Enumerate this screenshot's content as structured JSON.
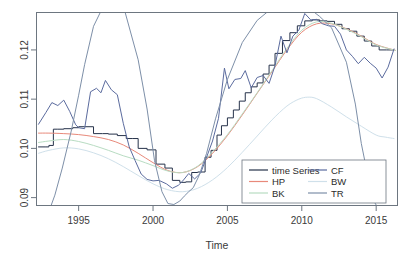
{
  "chart_data": {
    "type": "line",
    "title": "",
    "xlabel": "Time",
    "ylabel": "",
    "xlim": [
      1992.2,
      2016.4
    ],
    "ylim": [
      0.0885,
      0.1275
    ],
    "xticks": [
      1995,
      2000,
      2005,
      2010,
      2015
    ],
    "xtick_labels": [
      "1995",
      "2000",
      "2005",
      "2010",
      "2015"
    ],
    "yticks": [
      0.09,
      0.1,
      0.11,
      0.12
    ],
    "ytick_labels": [
      "0.09",
      "0.10",
      "0.11",
      "0.12"
    ],
    "grid": false,
    "legend_position": "bottom-right",
    "legend_columns": 2,
    "series": [
      {
        "name": "time Series",
        "color": "#26324a",
        "style": "step",
        "x": [
          1992.3,
          1992.8,
          1993.0,
          1993.3,
          1993.6,
          1994.0,
          1994.6,
          1995.0,
          1995.4,
          1996.0,
          1996.6,
          1997.0,
          1997.6,
          1998.2,
          1998.6,
          1999.0,
          1999.6,
          2000.2,
          2000.8,
          2001.3,
          2001.8,
          2002.2,
          2002.6,
          2003.0,
          2003.5,
          2003.9,
          2004.3,
          2004.6,
          2005.0,
          2005.4,
          2005.8,
          2006.2,
          2006.6,
          2007.0,
          2007.4,
          2007.8,
          2008.2,
          2008.7,
          2009.2,
          2009.7,
          2010.2,
          2010.7,
          2011.2,
          2011.7,
          2012.2,
          2012.7,
          2013.2,
          2013.7,
          2014.2,
          2014.7,
          2015.2,
          2015.7,
          2016.2
        ],
        "y": [
          0.1003,
          0.1003,
          0.1006,
          0.1039,
          0.1039,
          0.104,
          0.1042,
          0.1044,
          0.1044,
          0.103,
          0.103,
          0.1029,
          0.1026,
          0.102,
          0.102,
          0.1,
          0.0997,
          0.0968,
          0.096,
          0.0935,
          0.0931,
          0.0932,
          0.0951,
          0.0952,
          0.0982,
          0.0996,
          0.1027,
          0.1046,
          0.1062,
          0.1078,
          0.1096,
          0.1113,
          0.1125,
          0.1133,
          0.1151,
          0.1169,
          0.1193,
          0.1219,
          0.1235,
          0.1249,
          0.1259,
          0.1261,
          0.1259,
          0.1258,
          0.1252,
          0.1243,
          0.1238,
          0.1228,
          0.1218,
          0.1208,
          0.12,
          0.12,
          0.12
        ]
      },
      {
        "name": "HP",
        "color": "#e8897a",
        "style": "smooth",
        "x": [
          1992.3,
          1993.0,
          1994.0,
          1995.0,
          1996.0,
          1997.0,
          1998.0,
          1999.0,
          2000.0,
          2001.0,
          2002.0,
          2003.0,
          2004.0,
          2005.0,
          2006.0,
          2007.0,
          2008.0,
          2009.0,
          2010.0,
          2011.0,
          2012.0,
          2013.0,
          2014.0,
          2015.0,
          2016.3
        ],
        "y": [
          0.1031,
          0.1031,
          0.103,
          0.1028,
          0.1024,
          0.1018,
          0.1007,
          0.099,
          0.0971,
          0.0955,
          0.0951,
          0.0963,
          0.099,
          0.1026,
          0.1068,
          0.1112,
          0.1156,
          0.12,
          0.1236,
          0.1253,
          0.1253,
          0.1243,
          0.1228,
          0.1211,
          0.1199
        ]
      },
      {
        "name": "BK",
        "color": "#b8dcc2",
        "style": "smooth",
        "x": [
          1992.3,
          1993.0,
          1994.0,
          1995.0,
          1996.0,
          1997.0,
          1998.0,
          1999.0,
          2000.0,
          2001.0,
          2002.0,
          2003.0,
          2004.0,
          2005.0,
          2006.0,
          2007.0,
          2008.0,
          2009.0,
          2010.0,
          2011.0,
          2012.0,
          2013.0,
          2014.0,
          2015.0,
          2016.3
        ],
        "y": [
          0.1012,
          0.1015,
          0.1018,
          0.1014,
          0.1006,
          0.0996,
          0.0985,
          0.0976,
          0.0965,
          0.0954,
          0.0951,
          0.0964,
          0.0993,
          0.1028,
          0.107,
          0.1113,
          0.1158,
          0.1203,
          0.124,
          0.1257,
          0.1254,
          0.1242,
          0.1227,
          0.121,
          0.1199
        ]
      },
      {
        "name": "CF",
        "color": "#5b6b9e",
        "style": "wiggly",
        "x": [
          1992.3,
          1992.8,
          1993.2,
          1993.6,
          1994.0,
          1994.4,
          1994.8,
          1995.0,
          1995.4,
          1995.8,
          1996.2,
          1996.5,
          1996.8,
          1997.2,
          1997.6,
          1998.0,
          1998.4,
          1998.8,
          1999.2,
          1999.6,
          2000.0,
          2000.4,
          2000.9,
          2001.3,
          2001.7,
          2002.0,
          2002.4,
          2002.8,
          2003.2,
          2003.6,
          2004.0,
          2004.4,
          2004.8,
          2005.1,
          2005.5,
          2005.9,
          2006.2,
          2006.6,
          2007.0,
          2007.4,
          2007.8,
          2008.2,
          2008.6,
          2009.0,
          2009.4,
          2009.8,
          2010.2,
          2010.6,
          2011.0,
          2011.4,
          2011.8,
          2012.2,
          2012.6,
          2013.0,
          2013.4,
          2013.8,
          2014.2,
          2014.6,
          2015.0,
          2015.4,
          2015.8,
          2016.2
        ],
        "y": [
          0.1049,
          0.1073,
          0.1093,
          0.1087,
          0.1098,
          0.1075,
          0.1048,
          0.1042,
          0.104,
          0.1115,
          0.1122,
          0.1113,
          0.1138,
          0.1119,
          0.1109,
          0.1051,
          0.1003,
          0.0975,
          0.0948,
          0.0937,
          0.0934,
          0.0935,
          0.0928,
          0.0919,
          0.0925,
          0.0934,
          0.0949,
          0.0938,
          0.095,
          0.0982,
          0.1015,
          0.1061,
          0.1163,
          0.1121,
          0.114,
          0.1142,
          0.1158,
          0.1123,
          0.1144,
          0.1148,
          0.1132,
          0.1168,
          0.1228,
          0.1194,
          0.1228,
          0.124,
          0.1274,
          0.1261,
          0.1262,
          0.1253,
          0.1249,
          0.1248,
          0.1232,
          0.12,
          0.1187,
          0.1172,
          0.1185,
          0.1173,
          0.1163,
          0.1143,
          0.1165,
          0.1202
        ]
      },
      {
        "name": "BW",
        "color": "#cfe0ea",
        "style": "smooth",
        "x": [
          1992.3,
          1993.0,
          1994.0,
          1995.0,
          1996.0,
          1997.0,
          1998.0,
          1999.0,
          2000.0,
          2001.0,
          2002.0,
          2003.0,
          2004.0,
          2005.0,
          2006.0,
          2007.0,
          2008.0,
          2009.0,
          2009.8,
          2010.4,
          2011.0,
          2012.0,
          2013.0,
          2014.0,
          2015.0,
          2015.6,
          2016.2
        ],
        "y": [
          0.099,
          0.0996,
          0.1001,
          0.0999,
          0.0991,
          0.0979,
          0.0963,
          0.0945,
          0.0928,
          0.0916,
          0.0912,
          0.0919,
          0.0936,
          0.0961,
          0.0992,
          0.1025,
          0.1058,
          0.1086,
          0.11,
          0.1104,
          0.1101,
          0.1084,
          0.1064,
          0.1045,
          0.1027,
          0.1023,
          0.102
        ]
      },
      {
        "name": "TR",
        "color": "#7d8fa8",
        "style": "steep",
        "x": [
          1993.1,
          1993.4,
          1993.9,
          1994.5,
          1995.0,
          1995.4,
          1996.0,
          1997.0,
          1998.0,
          1999.0,
          1999.6,
          2000.1,
          2000.6,
          2001.0,
          2001.4,
          2001.8,
          2002.1,
          2002.4,
          2002.7,
          2003.1,
          2003.6,
          2004.2,
          2005.0,
          2006.0,
          2007.0,
          2008.0,
          2009.0,
          2010.0,
          2010.6,
          2011.2,
          2012.0,
          2013.0,
          2013.6,
          2014.0,
          2014.4,
          2014.9,
          2015.3
        ],
        "y": [
          0.088,
          0.0905,
          0.096,
          0.1035,
          0.1108,
          0.117,
          0.1248,
          0.131,
          0.129,
          0.118,
          0.108,
          0.0975,
          0.0912,
          0.0888,
          0.0886,
          0.0893,
          0.0903,
          0.0912,
          0.092,
          0.0945,
          0.099,
          0.106,
          0.114,
          0.1215,
          0.126,
          0.1285,
          0.1292,
          0.129,
          0.1282,
          0.1268,
          0.1245,
          0.1175,
          0.109,
          0.101,
          0.095,
          0.089,
          0.087
        ]
      }
    ]
  },
  "legend": {
    "column_left": [
      {
        "label": "time Series",
        "color": "#26324a"
      },
      {
        "label": "HP",
        "color": "#e8897a"
      },
      {
        "label": "BK",
        "color": "#b8dcc2"
      }
    ],
    "column_right": [
      {
        "label": "CF",
        "color": "#5b6b9e"
      },
      {
        "label": "BW",
        "color": "#cfe0ea"
      },
      {
        "label": "TR",
        "color": "#7d8fa8"
      }
    ]
  },
  "colors": {
    "frame": "#6d7680",
    "text": "#3a3a3a",
    "background": "#ffffff"
  }
}
